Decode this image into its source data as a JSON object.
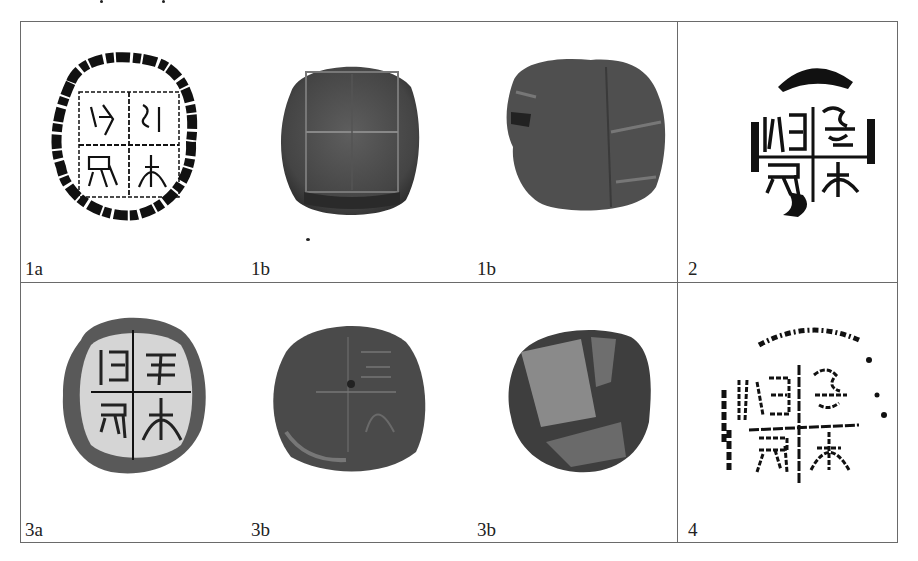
{
  "figure": {
    "panels": [
      {
        "id": "1a",
        "label": "1a",
        "type": "rubbing",
        "description": "ink rubbing of seal impression, 4-character grid"
      },
      {
        "id": "1b-front",
        "label": "1b",
        "type": "photo",
        "description": "clay sealing, impressed face"
      },
      {
        "id": "1b-back",
        "label": "1b",
        "type": "photo",
        "description": "clay sealing, reverse"
      },
      {
        "id": "2",
        "label": "2",
        "type": "rubbing",
        "description": "ink rubbing of seal impression, 4-character grid"
      },
      {
        "id": "3a",
        "label": "3a",
        "type": "rubbing",
        "description": "ink rubbing of seal impression, 4-character grid"
      },
      {
        "id": "3b-front",
        "label": "3b",
        "type": "photo",
        "description": "clay sealing, impressed face"
      },
      {
        "id": "3b-back",
        "label": "3b",
        "type": "photo",
        "description": "clay sealing, reverse"
      },
      {
        "id": "4",
        "label": "4",
        "type": "rubbing",
        "description": "ink rubbing of seal impression, 4-character grid"
      }
    ]
  },
  "colors": {
    "border": "#6a6a6a",
    "ink": "#111111",
    "clay_dark": "#3e3e3e",
    "clay_mid": "#5a5a5a",
    "clay_light": "#8a8a8a"
  }
}
